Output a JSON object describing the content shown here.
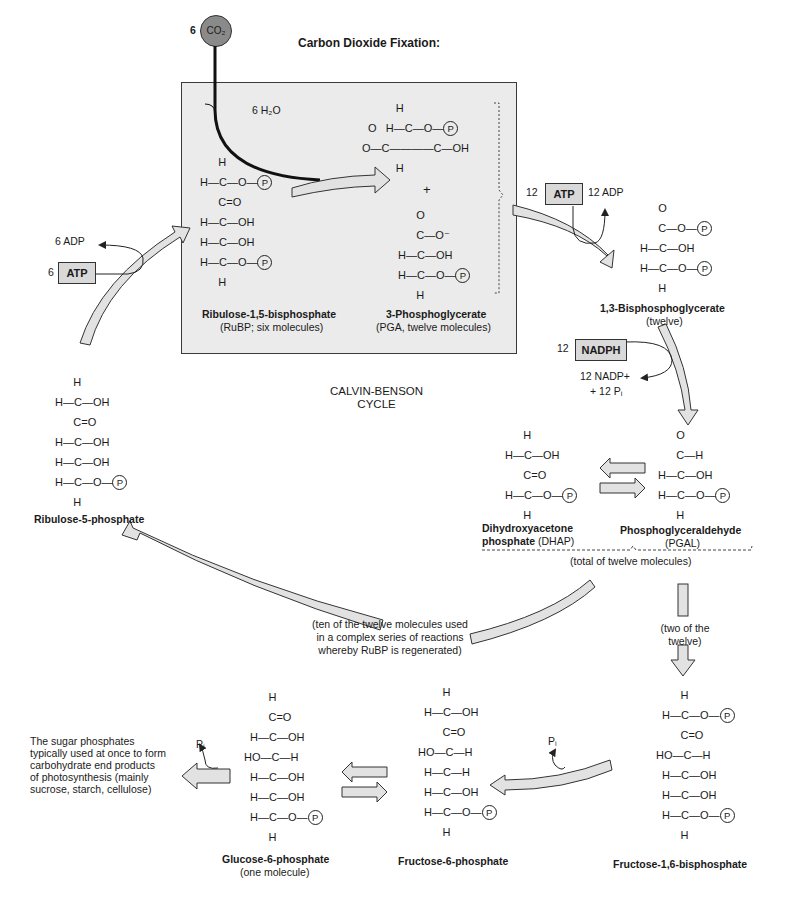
{
  "title": "Carbon Dioxide Fixation:",
  "cycle_label": [
    "CALVIN-BENSON",
    "CYCLE"
  ],
  "inputs": {
    "co2_count": "6",
    "co2_label": "CO₂",
    "h2o_label": "6 H₂O"
  },
  "energy": {
    "atp_left_count": "6",
    "atp_left_label": "ATP",
    "adp_left_label": "6 ADP",
    "atp_right_count": "12",
    "atp_right_label": "ATP",
    "adp_right_label": "12 ADP",
    "nadph_count": "12",
    "nadph_label": "NADPH",
    "nadp_label": "12 NADP+",
    "pi_label": "+ 12 Pᵢ"
  },
  "molecules": {
    "rubp": {
      "name": "Ribulose-1,5-bisphosphate",
      "sub": "(RuBP; six molecules)",
      "rows": [
        "H",
        "H—C—O—(P)",
        "C=O",
        "H—C—OH",
        "H—C—OH",
        "H—C—O—(P)",
        "H"
      ]
    },
    "pga": {
      "name": "3-Phosphoglycerate",
      "sub": "(PGA, twelve molecules)",
      "plus": "+"
    },
    "bpg": {
      "name": "1,3-Bisphosphoglycerate",
      "sub": "(twelve)"
    },
    "dhap": {
      "name_line1": "Dihydroxyacetone",
      "name_line2": "phosphate",
      "abbr": "(DHAP)"
    },
    "pgal": {
      "name": "Phosphoglyceraldehyde",
      "sub": "(PGAL)"
    },
    "ru5p": {
      "name": "Ribulose-5-phosphate"
    },
    "g6p": {
      "name": "Glucose-6-phosphate",
      "sub": "(one molecule)"
    },
    "f6p": {
      "name": "Fructose-6-phosphate"
    },
    "f16bp": {
      "name": "Fructose-1,6-bisphosphate"
    }
  },
  "notes": {
    "total": "(total of twelve molecules)",
    "ten_line1": "(ten of the twelve molecules used",
    "ten_line2": "in a complex series of reactions",
    "ten_line3": "whereby RuBP is regenerated)",
    "two_line1": "(two of the",
    "two_line2": "twelve)",
    "end_line1": "The sugar phosphates",
    "end_line2": "typically used at once to form",
    "end_line3": "carbohydrate end products",
    "end_line4": "of photosynthesis (mainly",
    "end_line5": "sucrose, starch, cellulose)",
    "pi_f16": "Pᵢ",
    "pi_g6": "Pᵢ"
  },
  "symbols": {
    "H": "H",
    "C": "C",
    "O": "O",
    "OH": "OH",
    "HO": "HO",
    "P": "P",
    "Ominus": "O⁻",
    "CO": "C=O",
    "dash": "—"
  },
  "colors": {
    "box_fill": "#ebebeb",
    "arrow_fill": "#e2e2e2",
    "co2_fill": "#8a8a8a",
    "stroke": "#222222"
  }
}
